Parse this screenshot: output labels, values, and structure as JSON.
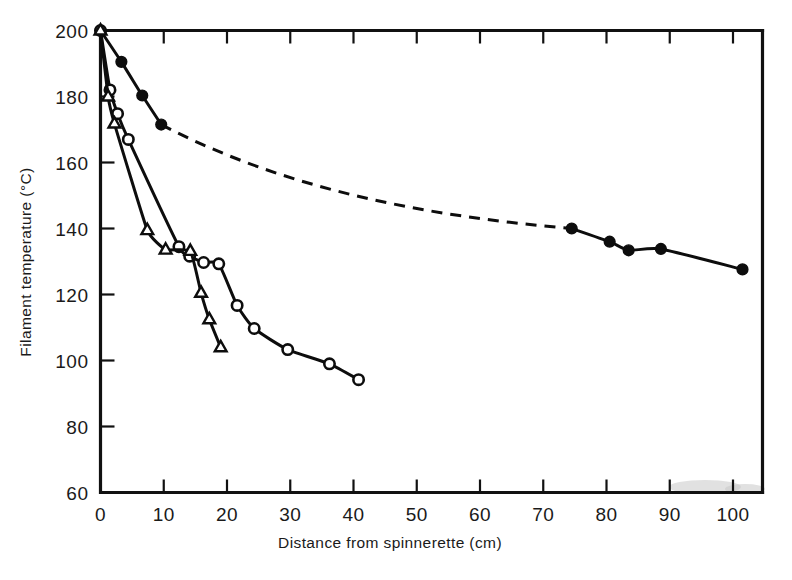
{
  "figure": {
    "background_color": "#ffffff",
    "ink_color": "#0d0d0d"
  },
  "chart_data": {
    "type": "line",
    "title": "",
    "xlabel": "Distance from spinnerette (cm)",
    "ylabel": "Filament temperature (°C)",
    "xlim": [
      0,
      104
    ],
    "ylim": [
      60,
      200
    ],
    "xticks": [
      0,
      10,
      20,
      30,
      40,
      50,
      60,
      70,
      80,
      90,
      100
    ],
    "xticklabels": [
      "0",
      "10",
      "20",
      "30",
      "40",
      "50",
      "60",
      "70",
      "80",
      "90",
      "100"
    ],
    "yticks": [
      60,
      80,
      100,
      120,
      140,
      160,
      180,
      200
    ],
    "yticklabels": [
      "60",
      "80",
      "100",
      "120",
      "140",
      "160",
      "180",
      "200"
    ],
    "grid": false,
    "legend": null,
    "series": [
      {
        "name": "filled-circle-series",
        "marker": "filled-circle",
        "linestyle": "solid-with-dashed-gap",
        "points": [
          {
            "x": 0.0,
            "y": 200.0
          },
          {
            "x": 3.3,
            "y": 190.5
          },
          {
            "x": 6.6,
            "y": 180.3
          },
          {
            "x": 9.6,
            "y": 171.5
          },
          {
            "x": 74.5,
            "y": 140.0
          },
          {
            "x": 80.5,
            "y": 136.0
          },
          {
            "x": 83.5,
            "y": 133.4
          },
          {
            "x": 88.6,
            "y": 133.8
          },
          {
            "x": 101.5,
            "y": 127.6
          }
        ],
        "dashed_gap": {
          "from_index": 3,
          "to_index": 4
        }
      },
      {
        "name": "open-circle-series",
        "marker": "open-circle",
        "linestyle": "solid",
        "points": [
          {
            "x": 0.0,
            "y": 200.0
          },
          {
            "x": 1.5,
            "y": 182.0
          },
          {
            "x": 2.7,
            "y": 174.8
          },
          {
            "x": 4.4,
            "y": 167.0
          },
          {
            "x": 12.4,
            "y": 134.5
          },
          {
            "x": 14.1,
            "y": 131.6
          },
          {
            "x": 16.3,
            "y": 129.7
          },
          {
            "x": 18.7,
            "y": 129.3
          },
          {
            "x": 21.6,
            "y": 116.7
          },
          {
            "x": 24.3,
            "y": 109.7
          },
          {
            "x": 29.6,
            "y": 103.3
          },
          {
            "x": 36.2,
            "y": 99.0
          },
          {
            "x": 40.8,
            "y": 94.2
          }
        ]
      },
      {
        "name": "open-triangle-series",
        "marker": "open-triangle",
        "linestyle": "solid",
        "points": [
          {
            "x": 0.0,
            "y": 200.0
          },
          {
            "x": 1.2,
            "y": 180.0
          },
          {
            "x": 2.2,
            "y": 171.8
          },
          {
            "x": 7.4,
            "y": 139.5
          },
          {
            "x": 10.3,
            "y": 133.6
          },
          {
            "x": 14.2,
            "y": 133.2
          },
          {
            "x": 15.9,
            "y": 120.5
          },
          {
            "x": 17.2,
            "y": 112.5
          },
          {
            "x": 19.0,
            "y": 104.0
          }
        ]
      }
    ]
  }
}
